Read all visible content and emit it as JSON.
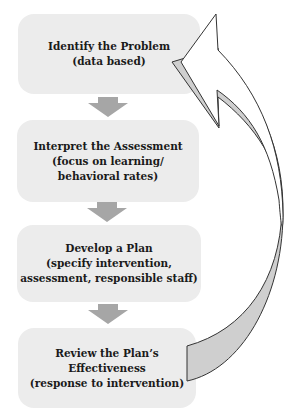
{
  "diagram": {
    "type": "cyclical process flow",
    "steps": [
      {
        "title": "Identify the Problem",
        "lines": [
          "Identify the Problem",
          "(data based)"
        ]
      },
      {
        "title": "Interpret the Assessment",
        "lines": [
          "Interpret the Assessment",
          "(focus on learning/",
          "behavioral rates)"
        ]
      },
      {
        "title": "Develop a Plan",
        "lines": [
          "Develop a Plan",
          "(specify intervention,",
          "assessment, responsible staff)"
        ]
      },
      {
        "title": "Review the Plan's Effectiveness",
        "lines": [
          "Review the Plan’s",
          "Effectiveness",
          "(response to intervention)"
        ]
      }
    ],
    "connectors": [
      {
        "from": 0,
        "to": 1,
        "icon": "down-arrow-icon"
      },
      {
        "from": 1,
        "to": 2,
        "icon": "down-arrow-icon"
      },
      {
        "from": 2,
        "to": 3,
        "icon": "down-arrow-icon"
      }
    ],
    "loop_arrow": {
      "from": 3,
      "to": 0,
      "icon": "curved-return-arrow-icon"
    },
    "colors": {
      "box_fill": "#ececec",
      "down_arrow_fill": "#a6a6a6",
      "loop_arrow_fill": "#cfcfcf",
      "loop_arrow_stroke": "#333333",
      "text": "#1a1a1a"
    }
  }
}
